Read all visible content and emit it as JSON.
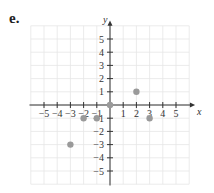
{
  "panel_label": "e.",
  "chart_data": {
    "type": "scatter",
    "title": "",
    "xlabel": "x",
    "ylabel": "y",
    "xlim": [
      -6,
      6
    ],
    "ylim": [
      -6,
      6
    ],
    "x_ticks": [
      -5,
      -4,
      -3,
      -2,
      -1,
      1,
      2,
      3,
      4,
      5
    ],
    "y_ticks": [
      5,
      4,
      3,
      2,
      1,
      -1,
      -2,
      -3,
      -4,
      -5
    ],
    "grid": true,
    "points": [
      {
        "x": 0,
        "y": 0
      },
      {
        "x": 2,
        "y": 1
      },
      {
        "x": -2,
        "y": -1
      },
      {
        "x": -1,
        "y": -1
      },
      {
        "x": 3,
        "y": -1
      },
      {
        "x": -3,
        "y": -3
      }
    ],
    "colors": {
      "point": "#9a9a9a",
      "grid": "#e6e6e6",
      "axis": "#333333"
    }
  }
}
